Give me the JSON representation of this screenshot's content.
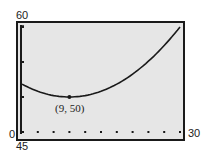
{
  "chart_data": {
    "type": "line",
    "title": "",
    "xlabel": "",
    "ylabel": "",
    "xlim": [
      0,
      30
    ],
    "ylim": [
      45,
      60
    ],
    "x_tick_labels": {
      "min": "0",
      "max": "30"
    },
    "y_tick_labels": {
      "min": "45",
      "max": "60"
    },
    "x_ticks_count": 11,
    "y_ticks": [
      45,
      50,
      55,
      60
    ],
    "grid": false,
    "series": [
      {
        "name": "parabola",
        "equation_hint": "y = 50 + 0.0227(x - 9)^2",
        "x": [
          0,
          3,
          6,
          9,
          12,
          15,
          18,
          21,
          24,
          27,
          30
        ],
        "values": [
          51.8,
          50.8,
          50.2,
          50.0,
          50.2,
          50.8,
          51.8,
          53.3,
          55.1,
          57.4,
          60.0
        ]
      }
    ],
    "annotations": [
      {
        "text": "(9, 50)",
        "x": 9,
        "y": 50,
        "marker": "point"
      }
    ]
  },
  "labels": {
    "y_max": "60",
    "y_min": "45",
    "x_min": "0",
    "x_max": "30",
    "vertex": "(9, 50)"
  },
  "colors": {
    "plot_bg": "#e6e6e6",
    "frame": "#1a1a1a",
    "curve": "#1a1a1a"
  }
}
